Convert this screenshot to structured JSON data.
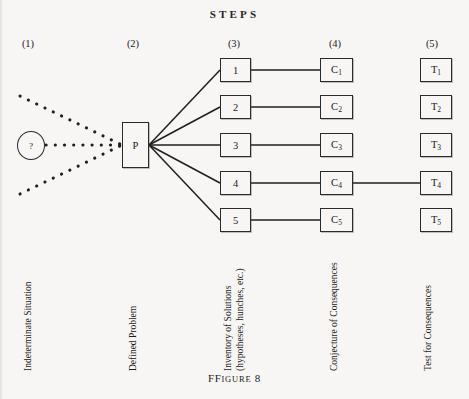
{
  "header": {
    "title": "STEPS"
  },
  "columns": [
    {
      "num": "(1)",
      "x": 28,
      "label": "Indeterminate Situation"
    },
    {
      "num": "(2)",
      "x": 133,
      "label": "Defined Problem"
    },
    {
      "num": "(3)",
      "x": 234,
      "label": "Inventory of Solutions",
      "label2": "(hypotheses, hunches, etc.)"
    },
    {
      "num": "(4)",
      "x": 335,
      "label": "Conjecture of Consequences"
    },
    {
      "num": "(5)",
      "x": 432,
      "label": "Test for Consequences"
    }
  ],
  "nodes": {
    "question": "?",
    "problem": "P",
    "solutions": [
      "1",
      "2",
      "3",
      "4",
      "5"
    ],
    "consequences": [
      "C",
      "C",
      "C",
      "C",
      "C"
    ],
    "consequence_subs": [
      "1",
      "2",
      "3",
      "4",
      "5"
    ],
    "tests": [
      "T",
      "T",
      "T",
      "T",
      "T"
    ],
    "test_subs": [
      "1",
      "2",
      "3",
      "4",
      "5"
    ]
  },
  "caption": {
    "word": "FIGURE",
    "number": "8"
  },
  "colors": {
    "ink": "#1a1a1a",
    "paper": "#f7f6f4",
    "rule": "#2a2a2a"
  }
}
